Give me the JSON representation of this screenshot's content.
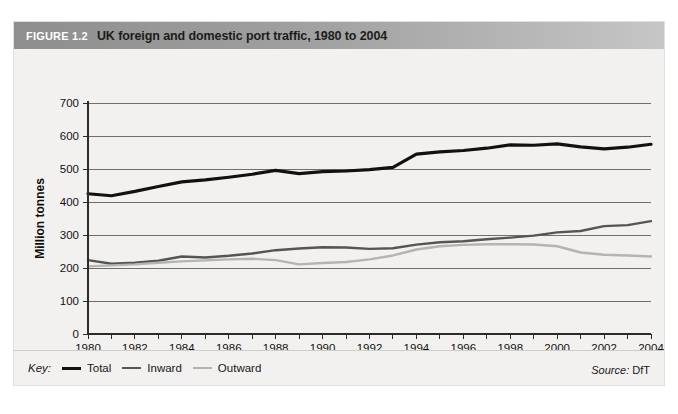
{
  "figure": {
    "number": "FIGURE 1.2",
    "title": "UK foreign and domestic port traffic, 1980 to 2004"
  },
  "legend": {
    "key_label": "Key:",
    "entries": [
      {
        "label": "Total",
        "color": "#111111"
      },
      {
        "label": "Inward",
        "color": "#555555"
      },
      {
        "label": "Outward",
        "color": "#b4b4b4"
      }
    ]
  },
  "source": {
    "label": "Source:",
    "value": "DfT"
  },
  "chart_data": {
    "type": "line",
    "title": "UK foreign and domestic port traffic, 1980 to 2004",
    "xlabel": "",
    "ylabel": "Million tonnes",
    "xlim": [
      1980,
      2004
    ],
    "ylim": [
      0,
      700
    ],
    "ytick_step": 100,
    "yticks": [
      0,
      100,
      200,
      300,
      400,
      500,
      600,
      700
    ],
    "grid": true,
    "legend_position": "bottom-left",
    "x": [
      1980,
      1981,
      1982,
      1983,
      1984,
      1985,
      1986,
      1987,
      1988,
      1989,
      1990,
      1991,
      1992,
      1993,
      1994,
      1995,
      1996,
      1997,
      1998,
      1999,
      2000,
      2001,
      2002,
      2003,
      2004
    ],
    "xtick_labels": [
      "1980",
      "1982",
      "1984",
      "1986",
      "1988",
      "1990",
      "1992",
      "1994",
      "1996",
      "1998",
      "2000",
      "2002",
      "2004"
    ],
    "series": [
      {
        "name": "Total",
        "color": "#111111",
        "width": 3.2,
        "values": [
          425,
          419,
          432,
          447,
          461,
          467,
          475,
          484,
          496,
          486,
          492,
          494,
          498,
          505,
          545,
          552,
          556,
          563,
          573,
          572,
          576,
          567,
          561,
          566,
          575
        ]
      },
      {
        "name": "Inward",
        "color": "#555555",
        "width": 2.4,
        "values": [
          224,
          213,
          216,
          222,
          235,
          232,
          237,
          244,
          254,
          259,
          263,
          262,
          258,
          260,
          271,
          278,
          281,
          287,
          292,
          298,
          308,
          312,
          327,
          330,
          342
        ]
      },
      {
        "name": "Outward",
        "color": "#b4b4b4",
        "width": 2.4,
        "values": [
          205,
          208,
          211,
          216,
          220,
          223,
          226,
          228,
          224,
          211,
          215,
          218,
          226,
          238,
          256,
          266,
          270,
          272,
          272,
          271,
          266,
          247,
          240,
          238,
          235
        ]
      }
    ]
  }
}
